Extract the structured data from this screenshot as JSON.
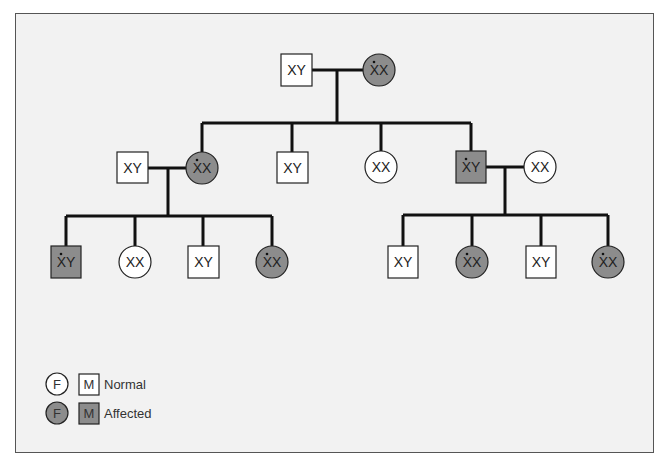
{
  "diagram": {
    "type": "pedigree",
    "colors": {
      "background": "#f2f2f2",
      "affected_fill": "#8c8c8c",
      "normal_fill": "#ffffff",
      "line": "#111111"
    },
    "generation1": [
      {
        "id": "g1m",
        "sex": "M",
        "label": "XY",
        "affected": false,
        "carrier_dot": false
      },
      {
        "id": "g1f",
        "sex": "F",
        "label": "XX",
        "affected": true,
        "carrier_dot": true
      }
    ],
    "generation2": [
      {
        "id": "g2-spouse-left",
        "sex": "M",
        "label": "XY",
        "affected": false,
        "carrier_dot": false
      },
      {
        "id": "g2-c1",
        "sex": "F",
        "label": "XX",
        "affected": true,
        "carrier_dot": true
      },
      {
        "id": "g2-c2",
        "sex": "M",
        "label": "XY",
        "affected": false,
        "carrier_dot": false
      },
      {
        "id": "g2-c3",
        "sex": "F",
        "label": "XX",
        "affected": false,
        "carrier_dot": false
      },
      {
        "id": "g2-c4",
        "sex": "M",
        "label": "XY",
        "affected": true,
        "carrier_dot": true
      },
      {
        "id": "g2-spouse-right",
        "sex": "F",
        "label": "XX",
        "affected": false,
        "carrier_dot": false
      }
    ],
    "generation3_left": [
      {
        "sex": "M",
        "label": "XY",
        "affected": true,
        "carrier_dot": true
      },
      {
        "sex": "F",
        "label": "XX",
        "affected": false,
        "carrier_dot": false
      },
      {
        "sex": "M",
        "label": "XY",
        "affected": false,
        "carrier_dot": false
      },
      {
        "sex": "F",
        "label": "XX",
        "affected": true,
        "carrier_dot": true
      }
    ],
    "generation3_right": [
      {
        "sex": "M",
        "label": "XY",
        "affected": false,
        "carrier_dot": false
      },
      {
        "sex": "F",
        "label": "XX",
        "affected": true,
        "carrier_dot": true
      },
      {
        "sex": "M",
        "label": "XY",
        "affected": false,
        "carrier_dot": false
      },
      {
        "sex": "F",
        "label": "XX",
        "affected": true,
        "carrier_dot": true
      }
    ]
  },
  "legend": {
    "female_symbol": "F",
    "male_symbol": "M",
    "normal_label": "Normal",
    "affected_label": "Affected"
  }
}
